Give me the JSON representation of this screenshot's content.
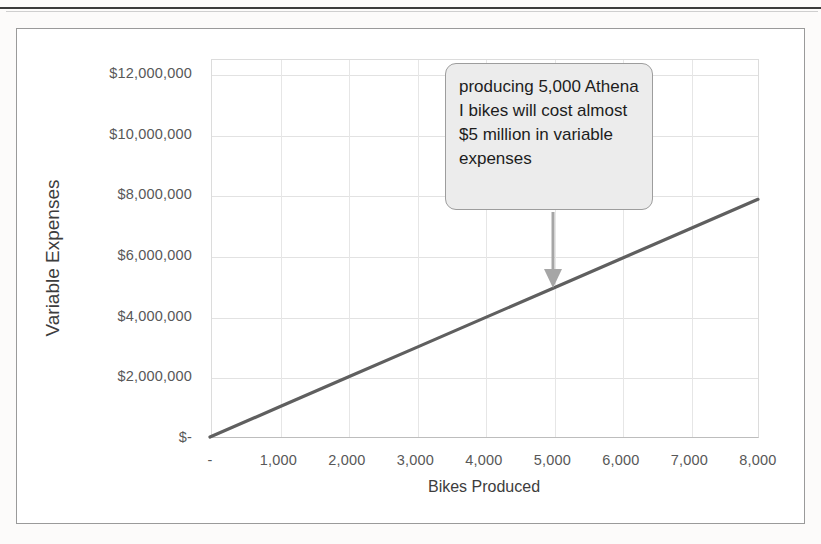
{
  "figure": {
    "frame_border_color": "#9a9a9a",
    "background": "#ffffff"
  },
  "callout": {
    "text": "producing 5,000 Athena I bikes will cost almost $5 million in variable expenses",
    "fill_color": "#ececec",
    "border_color": "#9d9d9d",
    "arrow_color": "#a6a6a6",
    "points_to": {
      "x_value": 5000,
      "y_value": 4900000
    }
  },
  "chart_data": {
    "type": "line",
    "title": "",
    "xlabel": "Bikes Produced",
    "ylabel": "Variable Expenses",
    "xlim": [
      0,
      8000
    ],
    "ylim": [
      0,
      12500000
    ],
    "grid": true,
    "legend": "none",
    "line_color": "#5f5f5f",
    "x_tick_labels": [
      "-",
      "1,000",
      "2,000",
      "3,000",
      "4,000",
      "5,000",
      "6,000",
      "7,000",
      "8,000"
    ],
    "x_tick_values": [
      0,
      1000,
      2000,
      3000,
      4000,
      5000,
      6000,
      7000,
      8000
    ],
    "y_tick_labels": [
      "$-",
      "$2,000,000",
      "$4,000,000",
      "$6,000,000",
      "$8,000,000",
      "$10,000,000",
      "$12,000,000"
    ],
    "y_tick_values": [
      0,
      2000000,
      4000000,
      6000000,
      8000000,
      10000000,
      12000000
    ],
    "series": [
      {
        "name": "Variable Expenses",
        "x": [
          0,
          1000,
          2000,
          3000,
          4000,
          5000,
          6000,
          7000,
          8000
        ],
        "values": [
          0,
          980000,
          1960000,
          2940000,
          3920000,
          4900000,
          5880000,
          6860000,
          7840000
        ]
      }
    ]
  }
}
